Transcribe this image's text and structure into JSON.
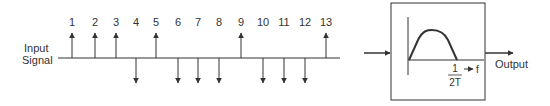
{
  "input_label": {
    "line1": "Input",
    "line2": "Signal"
  },
  "samples": [
    {
      "n": "1",
      "x": 72,
      "dir": "up"
    },
    {
      "n": "2",
      "x": 95,
      "dir": "up"
    },
    {
      "n": "3",
      "x": 116,
      "dir": "up"
    },
    {
      "n": "4",
      "x": 136,
      "dir": "down"
    },
    {
      "n": "5",
      "x": 156,
      "dir": "up"
    },
    {
      "n": "6",
      "x": 178,
      "dir": "down"
    },
    {
      "n": "7",
      "x": 198,
      "dir": "down"
    },
    {
      "n": "8",
      "x": 219,
      "dir": "down"
    },
    {
      "n": "9",
      "x": 241,
      "dir": "up"
    },
    {
      "n": "10",
      "x": 263,
      "dir": "down"
    },
    {
      "n": "11",
      "x": 284,
      "dir": "down"
    },
    {
      "n": "12",
      "x": 305,
      "dir": "down"
    },
    {
      "n": "13",
      "x": 326,
      "dir": "up"
    }
  ],
  "filter": {
    "cutoff_numerator": "1",
    "cutoff_denominator": "2T",
    "axis_label": "f"
  },
  "output_label": "Output",
  "colors": {
    "stroke": "#333333"
  }
}
